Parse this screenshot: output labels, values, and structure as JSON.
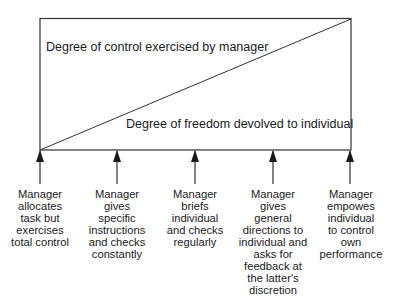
{
  "diagram": {
    "title_top": "Degree of control exercised by manager",
    "title_bottom": "Degree of freedom devolved to individual",
    "colors": {
      "line": "#333333",
      "text": "#1a1a1a",
      "background": "#ffffff"
    },
    "box": {
      "x": 40,
      "y": 18,
      "width": 311,
      "height": 132
    },
    "arrows": [
      {
        "x": 40,
        "lines": [
          "Manager",
          "allocates",
          "task but",
          "exercises",
          "total control"
        ]
      },
      {
        "x": 117,
        "lines": [
          "Manager",
          "gives",
          "specific",
          "instructions",
          "and checks",
          "constantly"
        ]
      },
      {
        "x": 195,
        "lines": [
          "Manager",
          "briefs",
          "individual",
          "and checks",
          "regularly"
        ]
      },
      {
        "x": 273,
        "lines": [
          "Manager",
          "gives",
          "general",
          "directions to",
          "individual and",
          "asks for",
          "feedback at",
          "the latter's",
          "discretion"
        ]
      },
      {
        "x": 350,
        "lines": [
          "Manager",
          "empowes",
          "individual",
          "to control",
          "own",
          "performance"
        ]
      }
    ]
  }
}
